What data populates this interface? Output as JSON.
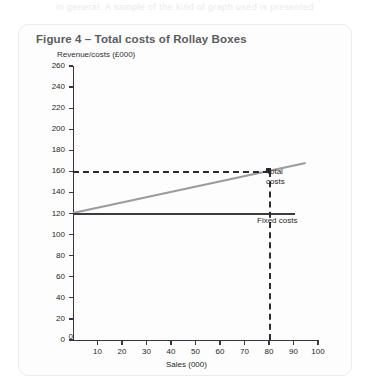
{
  "top_bleed_text": "in general. A sample of the kind of graph used is presented",
  "figure": {
    "title": "Figure 4 –  Total costs of Rollay Boxes"
  },
  "chart_data": {
    "type": "line",
    "title": "Figure 4 –  Total costs of Rollay Boxes",
    "xlabel": "Sales (000)",
    "ylabel": "Revenue/costs (£000)",
    "xlim": [
      0,
      100
    ],
    "ylim": [
      0,
      260
    ],
    "xticks": [
      0,
      10,
      20,
      30,
      40,
      50,
      60,
      70,
      80,
      90,
      100
    ],
    "yticks": [
      0,
      20,
      40,
      60,
      80,
      100,
      120,
      140,
      160,
      180,
      200,
      220,
      240,
      260
    ],
    "xtick_labels": [
      "0",
      "10",
      "20",
      "30",
      "40",
      "50",
      "60",
      "70",
      "80",
      "90",
      "100"
    ],
    "ytick_labels": [
      "0",
      "20",
      "40",
      "60",
      "80",
      "100",
      "120",
      "140",
      "160",
      "180",
      "200",
      "220",
      "240",
      "260"
    ],
    "grid": false,
    "legend": "inline-annotations",
    "series": [
      {
        "name": "Total costs",
        "color": "#9a9a9f",
        "style": "solid",
        "x": [
          0,
          95
        ],
        "values": [
          120,
          167.5
        ]
      },
      {
        "name": "Fixed costs",
        "color": "#3a3a40",
        "style": "solid",
        "x": [
          0,
          90.5
        ],
        "values": [
          120,
          120
        ]
      }
    ],
    "annotations": [
      {
        "name": "Total costs",
        "label": "Total costs",
        "label_line_1": "Total",
        "label_line_2": "costs"
      },
      {
        "name": "Fixed costs",
        "label": "Fixed costs"
      }
    ],
    "guides": [
      {
        "name": "breakeven-horizontal",
        "orientation": "horizontal",
        "value": 160,
        "style": "dashed",
        "from_x": 0,
        "to_x": 80
      },
      {
        "name": "breakeven-vertical",
        "orientation": "vertical",
        "value": 80,
        "style": "dashed",
        "from_y": 0,
        "to_y": 160
      }
    ],
    "breakeven_point": {
      "sales": 80,
      "revenue": 160
    }
  }
}
